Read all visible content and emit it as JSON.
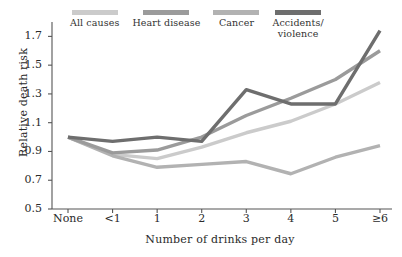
{
  "chart_data": {
    "type": "line",
    "title": "",
    "xlabel": "Number of drinks per day",
    "ylabel": "Relative death risk",
    "categories": [
      "None",
      "<1",
      "1",
      "2",
      "3",
      "4",
      "5",
      "≥6"
    ],
    "ylim": [
      0.5,
      1.8
    ],
    "yticks": [
      0.5,
      0.7,
      0.9,
      1.1,
      1.3,
      1.5,
      1.7
    ],
    "ytick_labels": [
      "0.5",
      "0.7",
      "0.9",
      "1.1",
      "1.3",
      "1.5",
      "1.7"
    ],
    "grid": false,
    "legend_position": "top",
    "series": [
      {
        "name": "All causes",
        "color": "#cbcbcb",
        "values": [
          1.0,
          0.88,
          0.85,
          0.93,
          1.03,
          1.11,
          1.23,
          1.38
        ]
      },
      {
        "name": "Heart disease",
        "color": "#9b9b9b",
        "values": [
          1.0,
          0.89,
          0.91,
          1.0,
          1.15,
          1.27,
          1.4,
          1.6
        ]
      },
      {
        "name": "Cancer",
        "color": "#b2b2b2",
        "values": [
          1.0,
          0.87,
          0.79,
          0.81,
          0.83,
          0.745,
          0.86,
          0.94
        ]
      },
      {
        "name": "Accidents/\nviolence",
        "color": "#6e6e6e",
        "values": [
          1.0,
          0.97,
          1.0,
          0.97,
          1.33,
          1.23,
          1.23,
          1.74
        ]
      }
    ]
  },
  "legend": {
    "items": [
      {
        "label": "All causes",
        "color": "#cbcbcb"
      },
      {
        "label": "Heart disease",
        "color": "#9b9b9b"
      },
      {
        "label": "Cancer",
        "color": "#b2b2b2"
      },
      {
        "label": "Accidents/\nviolence",
        "color": "#6e6e6e"
      }
    ]
  },
  "axes": {
    "y_title": "Relative death risk",
    "x_title": "Number of drinks per day",
    "y_ticks": [
      "1.7",
      "1.5",
      "1.3",
      "1.1",
      "0.9",
      "0.7",
      "0.5"
    ],
    "x_ticks": [
      "None",
      "<1",
      "1",
      "2",
      "3",
      "4",
      "5",
      "≥6"
    ],
    "axis_color": "#555555"
  }
}
